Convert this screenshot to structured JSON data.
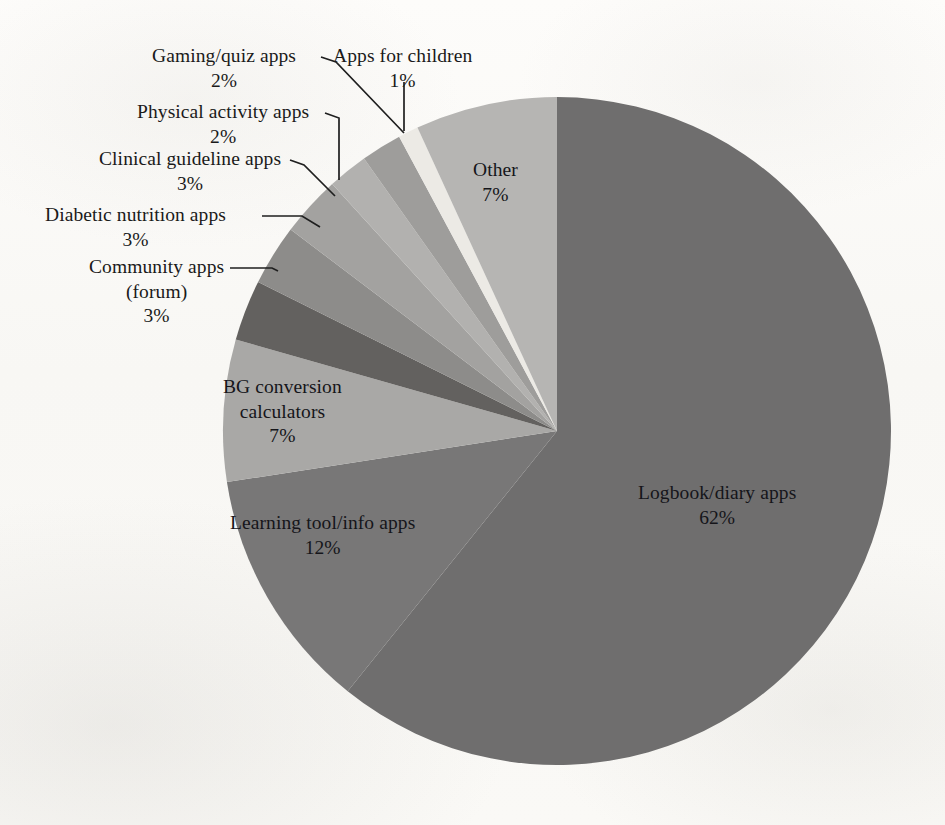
{
  "figure": {
    "background_color": "#fbfaf8",
    "text_color": "#1a1a1a",
    "leader_line_color": "#1f1f1f"
  },
  "chart_data": {
    "type": "pie",
    "title": "",
    "subtitle": "",
    "xlabel": "",
    "ylabel": "",
    "grid": false,
    "legend_position": "none",
    "label_format": "name + percent",
    "start_angle_deg": 0,
    "direction": "clockwise",
    "center": {
      "x": 557,
      "y": 431
    },
    "radius": 334,
    "total_percent": 102,
    "categories": [
      "Logbook/diary apps",
      "Learning tool/info apps",
      "BG conversion calculators",
      "Community apps (forum)",
      "Diabetic nutrition apps",
      "Clinical guideline apps",
      "Physical activity apps",
      "Gaming/quiz apps",
      "Apps for children",
      "Other"
    ],
    "values": [
      62,
      12,
      7,
      3,
      3,
      3,
      2,
      2,
      1,
      7
    ],
    "slices": [
      {
        "name": "Logbook/diary apps",
        "value": 62,
        "percent_label": "62%",
        "color": "#6f6e6e",
        "start_deg": 0,
        "end_deg": 218.8,
        "label_placement": "inside"
      },
      {
        "name": "Learning tool/info apps",
        "value": 12,
        "percent_label": "12%",
        "color": "#787777",
        "start_deg": 218.8,
        "end_deg": 261.2,
        "label_placement": "inside"
      },
      {
        "name": "BG conversion calculators",
        "value": 7,
        "percent_label": "7%",
        "color": "#a9a8a6",
        "start_deg": 261.2,
        "end_deg": 285.9,
        "label_placement": "inside"
      },
      {
        "name": "Community apps (forum)",
        "value": 3,
        "percent_label": "3%",
        "color": "#63615f",
        "start_deg": 285.9,
        "end_deg": 296.5,
        "label_placement": "outside"
      },
      {
        "name": "Diabetic nutrition apps",
        "value": 3,
        "percent_label": "3%",
        "color": "#8d8c8a",
        "start_deg": 296.5,
        "end_deg": 307.1,
        "label_placement": "outside"
      },
      {
        "name": "Clinical guideline apps",
        "value": 3,
        "percent_label": "3%",
        "color": "#a3a2a0",
        "start_deg": 307.1,
        "end_deg": 317.7,
        "label_placement": "outside"
      },
      {
        "name": "Physical activity apps",
        "value": 2,
        "percent_label": "2%",
        "color": "#b2b1af",
        "start_deg": 317.7,
        "end_deg": 324.7,
        "label_placement": "outside"
      },
      {
        "name": "Gaming/quiz apps",
        "value": 2,
        "percent_label": "2%",
        "color": "#9e9d9b",
        "start_deg": 324.7,
        "end_deg": 331.8,
        "label_placement": "outside"
      },
      {
        "name": "Apps for children",
        "value": 1,
        "percent_label": "1%",
        "color": "#eceae5",
        "start_deg": 331.8,
        "end_deg": 335.3,
        "label_placement": "outside"
      },
      {
        "name": "Other",
        "value": 7,
        "percent_label": "7%",
        "color": "#b6b5b3",
        "start_deg": 335.3,
        "end_deg": 360,
        "label_placement": "inside"
      }
    ]
  },
  "labels": {
    "gaming_quiz": {
      "name": "Gaming/quiz apps",
      "percent": "2%"
    },
    "apps_children": {
      "name": "Apps for children",
      "percent": "1%"
    },
    "physical_activity": {
      "name": "Physical activity apps",
      "percent": "2%"
    },
    "clinical_guideline": {
      "name": "Clinical guideline apps",
      "percent": "3%"
    },
    "diabetic_nutrition": {
      "name": "Diabetic nutrition apps",
      "percent": "3%"
    },
    "community_line1": {
      "name": "Community apps",
      "name2": "(forum)",
      "percent": "3%"
    },
    "bg_conversion": {
      "name": "BG conversion",
      "name2": "calculators",
      "percent": "7%"
    },
    "learning_tool": {
      "name": "Learning tool/info apps",
      "percent": "12%"
    },
    "logbook": {
      "name": "Logbook/diary apps",
      "percent": "62%"
    },
    "other": {
      "name": "Other",
      "percent": "7%"
    }
  }
}
